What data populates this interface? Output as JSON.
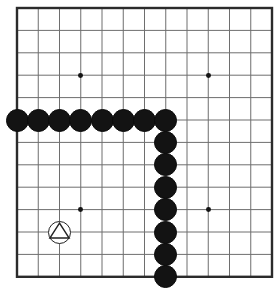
{
  "board": {
    "kind": "go-board-diagram",
    "size": 13,
    "columns": 13,
    "rows": 13,
    "line_color": "#6e6e6e",
    "border_color": "#2b2b2b",
    "background_color": "#ffffff",
    "black_stone_color": "#131313",
    "white_stone_color": "#ffffff",
    "star_point_color": "#141414",
    "geometry": {
      "origin_x": 17,
      "origin_y": 8,
      "cell_x": 21.25,
      "cell_y": 22.4,
      "stone_radius": 11.5,
      "star_radius": 2.4,
      "border_width": 2.4,
      "line_width": 1
    },
    "star_points": [
      {
        "col": 3,
        "row": 3
      },
      {
        "col": 9,
        "row": 3
      },
      {
        "col": 3,
        "row": 9
      },
      {
        "col": 9,
        "row": 9
      }
    ],
    "stones": [
      {
        "color": "black",
        "col": 0,
        "row": 5,
        "label": "black-stone"
      },
      {
        "color": "black",
        "col": 1,
        "row": 5,
        "label": "black-stone"
      },
      {
        "color": "black",
        "col": 2,
        "row": 5,
        "label": "black-stone"
      },
      {
        "color": "black",
        "col": 3,
        "row": 5,
        "label": "black-stone"
      },
      {
        "color": "black",
        "col": 4,
        "row": 5,
        "label": "black-stone"
      },
      {
        "color": "black",
        "col": 5,
        "row": 5,
        "label": "black-stone"
      },
      {
        "color": "black",
        "col": 6,
        "row": 5,
        "label": "black-stone"
      },
      {
        "color": "black",
        "col": 7,
        "row": 5,
        "label": "black-stone"
      },
      {
        "color": "black",
        "col": 7,
        "row": 6,
        "label": "black-stone"
      },
      {
        "color": "black",
        "col": 7,
        "row": 7,
        "label": "black-stone"
      },
      {
        "color": "black",
        "col": 7,
        "row": 8,
        "label": "black-stone"
      },
      {
        "color": "black",
        "col": 7,
        "row": 9,
        "label": "black-stone"
      },
      {
        "color": "black",
        "col": 7,
        "row": 10,
        "label": "black-stone"
      },
      {
        "color": "black",
        "col": 7,
        "row": 11,
        "label": "black-stone"
      },
      {
        "color": "black",
        "col": 7,
        "row": 12,
        "label": "black-stone"
      },
      {
        "color": "white",
        "col": 2,
        "row": 10,
        "label": "white-stone",
        "marker": "triangle"
      }
    ],
    "markers": [
      {
        "type": "triangle",
        "col": 2,
        "row": 10,
        "name": "triangle-marker",
        "color": "#222222"
      }
    ],
    "counts": {
      "black_stones": 15,
      "white_stones": 1,
      "marked_stones": 1
    }
  }
}
